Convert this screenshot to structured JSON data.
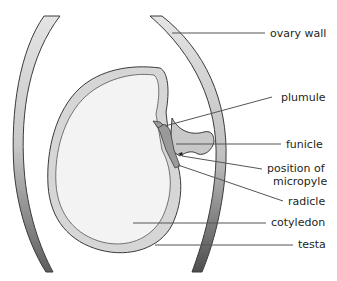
{
  "diagram": {
    "labels": [
      {
        "id": "ovary-wall",
        "text": "ovary wall",
        "x": 270,
        "y": 37
      },
      {
        "id": "plumule",
        "text": "plumule",
        "x": 281,
        "y": 98
      },
      {
        "id": "funicle",
        "text": "funicle",
        "x": 286,
        "y": 145
      },
      {
        "id": "position-of",
        "text": "position of",
        "x": 267,
        "y": 172
      },
      {
        "id": "micropyle",
        "text": "micropyle",
        "x": 273,
        "y": 185
      },
      {
        "id": "radicle",
        "text": "radicle",
        "x": 288,
        "y": 205
      },
      {
        "id": "cotyledon",
        "text": "cotyledon",
        "x": 271,
        "y": 226
      },
      {
        "id": "testa",
        "text": "testa",
        "x": 298,
        "y": 248
      }
    ],
    "colors": {
      "wall_light": "#e2e2e2",
      "wall_dark": "#5a5a5a",
      "outline": "#3a3a3a",
      "cotyledon_fill": "#f3f3f3",
      "testa_fill": "#d6d6d6",
      "embryo_fill": "#9a9a9a",
      "leader_line": "#555555",
      "text": "#231f20"
    }
  }
}
